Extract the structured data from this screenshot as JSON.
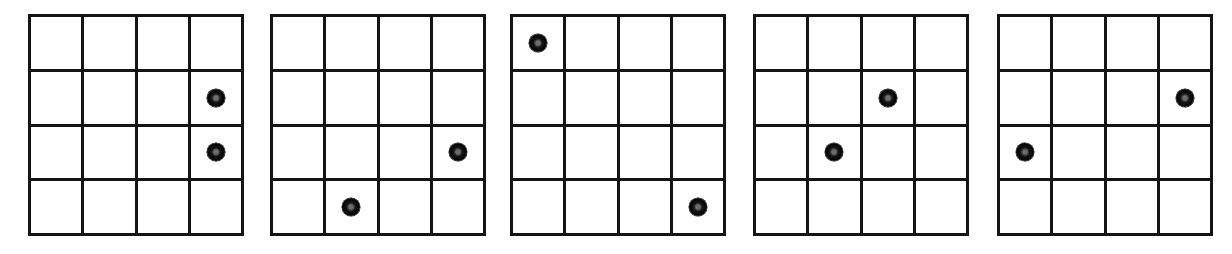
{
  "figure": {
    "kind": "dot-pattern-grid-series",
    "panel_count": 5,
    "grid_rows": 4,
    "grid_cols": 4,
    "dot_color": "#000000",
    "dot_core_color": "#6d6d6d",
    "line_color": "#141414",
    "background_color": "#ffffff"
  },
  "panels": [
    {
      "id": "panel-1",
      "left": 28,
      "top": 14,
      "width": 216,
      "height": 222,
      "dots": [
        {
          "row": 2,
          "col": 4
        },
        {
          "row": 3,
          "col": 4
        }
      ],
      "cells": [
        [
          "empty",
          "empty",
          "empty",
          "empty"
        ],
        [
          "empty",
          "empty",
          "empty",
          "dot"
        ],
        [
          "empty",
          "empty",
          "empty",
          "dot"
        ],
        [
          "empty",
          "empty",
          "empty",
          "empty"
        ]
      ]
    },
    {
      "id": "panel-2",
      "left": 270,
      "top": 14,
      "width": 216,
      "height": 222,
      "dots": [
        {
          "row": 3,
          "col": 4
        },
        {
          "row": 4,
          "col": 2
        }
      ],
      "cells": [
        [
          "empty",
          "empty",
          "empty",
          "empty"
        ],
        [
          "empty",
          "empty",
          "empty",
          "empty"
        ],
        [
          "empty",
          "empty",
          "empty",
          "dot"
        ],
        [
          "empty",
          "dot",
          "empty",
          "empty"
        ]
      ]
    },
    {
      "id": "panel-3",
      "left": 510,
      "top": 14,
      "width": 216,
      "height": 222,
      "dots": [
        {
          "row": 1,
          "col": 1
        },
        {
          "row": 4,
          "col": 4
        }
      ],
      "cells": [
        [
          "dot",
          "empty",
          "empty",
          "empty"
        ],
        [
          "empty",
          "empty",
          "empty",
          "empty"
        ],
        [
          "empty",
          "empty",
          "empty",
          "empty"
        ],
        [
          "empty",
          "empty",
          "empty",
          "dot"
        ]
      ]
    },
    {
      "id": "panel-4",
      "left": 753,
      "top": 14,
      "width": 216,
      "height": 222,
      "dots": [
        {
          "row": 2,
          "col": 3
        },
        {
          "row": 3,
          "col": 2
        }
      ],
      "cells": [
        [
          "empty",
          "empty",
          "empty",
          "empty"
        ],
        [
          "empty",
          "empty",
          "dot",
          "empty"
        ],
        [
          "empty",
          "dot",
          "empty",
          "empty"
        ],
        [
          "empty",
          "empty",
          "empty",
          "empty"
        ]
      ]
    },
    {
      "id": "panel-5",
      "left": 997,
      "top": 14,
      "width": 216,
      "height": 222,
      "dots": [
        {
          "row": 2,
          "col": 4
        },
        {
          "row": 3,
          "col": 1
        }
      ],
      "cells": [
        [
          "empty",
          "empty",
          "empty",
          "empty"
        ],
        [
          "empty",
          "empty",
          "empty",
          "dot"
        ],
        [
          "dot",
          "empty",
          "empty",
          "empty"
        ],
        [
          "empty",
          "empty",
          "empty",
          "empty"
        ]
      ]
    }
  ]
}
